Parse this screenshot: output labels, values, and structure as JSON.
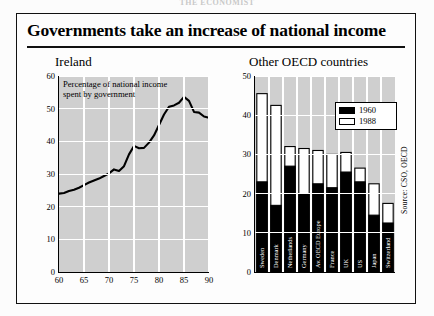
{
  "masthead": "THE ECONOMIST",
  "figure": {
    "title": "Governments take an increase of national income",
    "source": "Source: CSO, OECD"
  },
  "legend": {
    "items": [
      {
        "label": "1960",
        "swatch": "black",
        "color": "#000000"
      },
      {
        "label": "1988",
        "swatch": "white",
        "color": "#ffffff"
      }
    ]
  },
  "chart_data": [
    {
      "type": "line",
      "title": "Ireland",
      "annotation": [
        "Percentage of national income",
        "spent by government"
      ],
      "xlabel": "",
      "ylabel": "",
      "xlim": [
        60,
        90
      ],
      "ylim": [
        0,
        60
      ],
      "xticks": [
        "60",
        "65",
        "70",
        "75",
        "80",
        "85",
        "90"
      ],
      "yticks": [
        "0",
        "10",
        "20",
        "30",
        "40",
        "50",
        "60"
      ],
      "grid": true,
      "x": [
        60,
        61,
        62,
        63,
        64,
        65,
        66,
        67,
        68,
        69,
        70,
        71,
        72,
        73,
        74,
        75,
        76,
        77,
        78,
        79,
        80,
        81,
        82,
        83,
        84,
        85,
        86,
        87,
        88,
        89,
        90
      ],
      "values": [
        24.0,
        24.2,
        24.8,
        25.2,
        25.8,
        26.6,
        27.4,
        28.0,
        28.6,
        29.4,
        30.2,
        31.4,
        30.9,
        32.4,
        36.0,
        38.6,
        37.9,
        38.0,
        39.6,
        41.8,
        45.0,
        48.2,
        50.6,
        51.0,
        51.8,
        53.6,
        52.4,
        49.0,
        48.8,
        47.6,
        47.2
      ]
    },
    {
      "type": "bar",
      "subtype": "stacked",
      "title": "Other OECD countries",
      "xlabel": "",
      "ylabel": "",
      "ylim": [
        0,
        50
      ],
      "yticks": [
        "0",
        "10",
        "20",
        "30",
        "40",
        "50"
      ],
      "grid": true,
      "categories": [
        "Sweden",
        "Denmark",
        "Netherlands",
        "Germany",
        "Av. OECD Europe",
        "France",
        "UK",
        "US",
        "Japan",
        "Switzerland"
      ],
      "series": [
        {
          "name": "1960",
          "values": [
            23.0,
            17.0,
            27.0,
            20.0,
            22.5,
            21.5,
            25.5,
            23.0,
            14.5,
            12.5
          ]
        },
        {
          "name": "1988",
          "values": [
            45.5,
            42.5,
            32.0,
            31.5,
            31.0,
            30.0,
            30.5,
            26.5,
            22.5,
            17.5
          ]
        }
      ]
    }
  ]
}
